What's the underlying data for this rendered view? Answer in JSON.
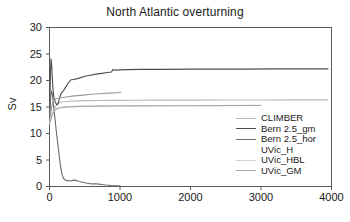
{
  "chart_data": {
    "type": "line",
    "title": "North Atlantic overturning",
    "xlabel": "",
    "ylabel": "Sv",
    "xlim": [
      0,
      4000
    ],
    "ylim": [
      0,
      30
    ],
    "xticks": [
      0,
      1000,
      2000,
      3000,
      4000
    ],
    "yticks": [
      0,
      5,
      10,
      15,
      20,
      25,
      30
    ],
    "xtick_labels": [
      "0",
      "1000",
      "2000",
      "3000",
      "4000"
    ],
    "ytick_labels": [
      "0",
      "5",
      "10",
      "15",
      "20",
      "25",
      "30"
    ],
    "grid": false,
    "legend_position": "center-right",
    "series": [
      {
        "name": "CLIMBER",
        "color": "#b9b9b9",
        "x": [
          0,
          10,
          20,
          35,
          50,
          70,
          90,
          110,
          130,
          160,
          200,
          250,
          300,
          400,
          500,
          700,
          900,
          1200,
          1600,
          2000,
          2500,
          3000,
          3500,
          3950
        ],
        "values": [
          12.0,
          12.3,
          12.9,
          13.6,
          14.2,
          14.8,
          15.2,
          15.5,
          15.7,
          15.9,
          16.0,
          16.05,
          16.1,
          16.15,
          16.2,
          16.22,
          16.25,
          16.28,
          16.3,
          16.3,
          16.32,
          16.33,
          16.34,
          16.35
        ]
      },
      {
        "name": "Bern 2.5_gm",
        "color": "#4d4d4d",
        "x": [
          0,
          8,
          15,
          22,
          30,
          40,
          50,
          60,
          70,
          80,
          95,
          110,
          125,
          140,
          160,
          180,
          200,
          230,
          260,
          300,
          340,
          380,
          430,
          500,
          580,
          660,
          740,
          820,
          880,
          900,
          920,
          960,
          1000,
          1100,
          1300,
          1600,
          2000,
          2400,
          2800,
          3200,
          3600,
          3950
        ],
        "values": [
          12.2,
          17.5,
          22.0,
          24.1,
          23.0,
          20.5,
          18.4,
          17.0,
          16.4,
          16.0,
          15.6,
          15.4,
          15.8,
          16.6,
          17.4,
          17.8,
          18.1,
          18.8,
          19.4,
          20.1,
          20.2,
          20.3,
          20.5,
          20.8,
          21.0,
          21.2,
          21.35,
          21.5,
          21.6,
          22.1,
          21.95,
          21.95,
          22.0,
          22.05,
          22.1,
          22.1,
          22.15,
          22.15,
          22.15,
          22.2,
          22.2,
          22.2
        ]
      },
      {
        "name": "Bern 2.5_hor",
        "color": "#6b6b6b",
        "x": [
          0,
          10,
          20,
          30,
          45,
          60,
          80,
          100,
          120,
          140,
          160,
          180,
          200,
          230,
          260,
          300,
          340,
          380,
          420,
          470,
          520,
          570,
          620,
          660,
          700,
          740,
          800,
          880,
          960,
          1000
        ],
        "values": [
          12.0,
          15.0,
          17.5,
          18.0,
          17.0,
          15.0,
          12.5,
          10.0,
          7.8,
          5.5,
          3.5,
          2.2,
          1.5,
          1.15,
          1.1,
          1.05,
          1.2,
          1.15,
          0.95,
          0.8,
          0.65,
          0.55,
          0.5,
          0.52,
          0.45,
          0.38,
          0.28,
          0.2,
          0.15,
          0.12
        ]
      },
      {
        "name": "UVic_H",
        "color": "#9a9a9a",
        "x": [
          0,
          15,
          30,
          50,
          70,
          90,
          110,
          140,
          170,
          210,
          260,
          320,
          400,
          480,
          560,
          650,
          750,
          850,
          950,
          1010
        ],
        "values": [
          12.1,
          13.8,
          15.0,
          15.9,
          16.3,
          16.5,
          16.6,
          16.7,
          16.75,
          16.85,
          16.95,
          17.05,
          17.15,
          17.25,
          17.35,
          17.45,
          17.55,
          17.62,
          17.7,
          17.75
        ]
      },
      {
        "name": "UVic_HBL",
        "color": "#d2d2d2",
        "x": [
          0,
          15,
          30,
          50,
          75,
          100,
          130,
          170,
          220,
          280,
          360,
          450,
          560,
          700,
          900,
          1200,
          1600,
          2000,
          2400,
          2800,
          3000
        ],
        "values": [
          11.9,
          12.6,
          13.3,
          14.0,
          14.5,
          14.7,
          14.85,
          14.95,
          15.02,
          15.08,
          15.12,
          15.15,
          15.18,
          15.2,
          15.22,
          15.24,
          15.26,
          15.28,
          15.28,
          15.3,
          15.3
        ]
      },
      {
        "name": "UVic_GM",
        "color": "#a8a8a8",
        "x": [
          0,
          15,
          30,
          50,
          75,
          100,
          130,
          170,
          220,
          280,
          360,
          450,
          560,
          700,
          900,
          1200,
          1600,
          2000,
          2400,
          2800,
          3000
        ],
        "values": [
          11.8,
          12.4,
          13.1,
          13.8,
          14.3,
          14.6,
          14.78,
          14.9,
          14.98,
          15.04,
          15.08,
          15.11,
          15.14,
          15.17,
          15.19,
          15.21,
          15.23,
          15.25,
          15.26,
          15.27,
          15.28
        ]
      }
    ]
  },
  "legend": {
    "items": [
      {
        "label": "CLIMBER",
        "color": "#b9b9b9"
      },
      {
        "label": "Bern 2.5_gm",
        "color": "#4d4d4d"
      },
      {
        "label": "Bern 2.5_hor",
        "color": "#6b6b6b"
      },
      {
        "label": "UVic_H",
        "color": "#ffffff"
      },
      {
        "label": "UVic_HBL",
        "color": "#d2d2d2"
      },
      {
        "label": "UVic_GM",
        "color": "#a8a8a8"
      }
    ]
  },
  "axes": {
    "frame_color": "#5a5a5a"
  }
}
